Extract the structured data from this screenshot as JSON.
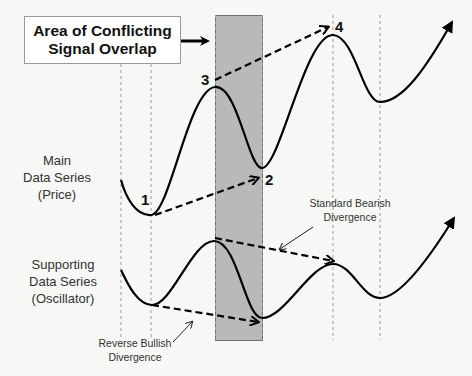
{
  "title_box": {
    "line1": "Area of Conflicting",
    "line2": "Signal Overlap"
  },
  "labels": {
    "main_series": {
      "line1": "Main",
      "line2": "Data Series",
      "line3": "(Price)"
    },
    "supporting_series": {
      "line1": "Supporting",
      "line2": "Data Series",
      "line3": "(Oscillator)"
    },
    "bearish": {
      "line1": "Standard Bearish",
      "line2": "Divergence"
    },
    "bullish": {
      "line1": "Reverse Bullish",
      "line2": "Divergence"
    }
  },
  "points": {
    "p1": "1",
    "p2": "2",
    "p3": "3",
    "p4": "4"
  },
  "colors": {
    "shade_fill": "#b9b9b9",
    "shade_border": "#6e6e6e",
    "curve": "#000000",
    "guide": "#9a9a9a",
    "background": "#f7f7f5"
  }
}
